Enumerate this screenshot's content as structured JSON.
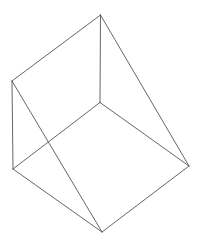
{
  "figure": {
    "stroke_color": "#555555",
    "background": "#ffffff",
    "vertices": {
      "top": [
        100.5,
        15
      ],
      "left_top": [
        12,
        81
      ],
      "center": [
        100,
        102.5
      ],
      "left_bottom": [
        13,
        169
      ],
      "right": [
        189,
        166
      ],
      "bottom": [
        102,
        232
      ]
    },
    "edges": [
      [
        "top",
        "left_top"
      ],
      [
        "top",
        "center"
      ],
      [
        "top",
        "right"
      ],
      [
        "left_top",
        "left_bottom"
      ],
      [
        "left_top",
        "bottom"
      ],
      [
        "center",
        "left_bottom"
      ],
      [
        "center",
        "right"
      ],
      [
        "left_bottom",
        "bottom"
      ],
      [
        "bottom",
        "right"
      ]
    ]
  }
}
